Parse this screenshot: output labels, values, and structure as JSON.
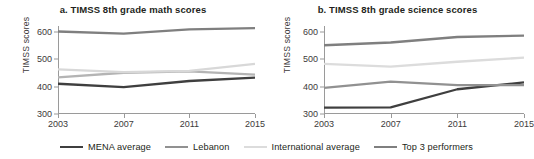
{
  "chart_data": [
    {
      "type": "line",
      "panel": "a",
      "title": "a. TIMSS 8th grade math scores",
      "xlabel": "",
      "ylabel": "TIMSS scores",
      "x": [
        2003,
        2007,
        2011,
        2015
      ],
      "xticklabels": [
        "2003",
        "2007",
        "2011",
        "2015"
      ],
      "yticks": [
        300,
        400,
        500,
        600
      ],
      "yticklabels": [
        "300",
        "400",
        "500",
        "600"
      ],
      "ylim": [
        300,
        620
      ],
      "xlim": [
        2003,
        2015
      ],
      "grid": false,
      "legend": "bottom",
      "series": [
        {
          "name": "MENA average",
          "color": "#3f3f3f",
          "values": [
            410,
            398,
            420,
            432
          ]
        },
        {
          "name": "Lebanon",
          "color": "#b4b4b4",
          "values": [
            433,
            450,
            455,
            443
          ]
        },
        {
          "name": "International average",
          "color": "#d8d8d8",
          "values": [
            462,
            452,
            457,
            482
          ]
        },
        {
          "name": "Top 3 performers",
          "color": "#7f7f7f",
          "values": [
            600,
            592,
            608,
            612
          ]
        }
      ]
    },
    {
      "type": "line",
      "panel": "b",
      "title": "b. TIMSS 8th grade science scores",
      "xlabel": "",
      "ylabel": "TIMSS scores",
      "x": [
        2003,
        2007,
        2011,
        2015
      ],
      "xticklabels": [
        "2003",
        "2007",
        "2011",
        "2015"
      ],
      "yticks": [
        300,
        400,
        500,
        600
      ],
      "yticklabels": [
        "300",
        "400",
        "500",
        "600"
      ],
      "ylim": [
        300,
        620
      ],
      "xlim": [
        2003,
        2015
      ],
      "grid": false,
      "legend": "bottom",
      "series": [
        {
          "name": "MENA average",
          "color": "#3f3f3f",
          "values": [
            323,
            324,
            390,
            415
          ]
        },
        {
          "name": "Lebanon",
          "color": "#919191",
          "values": [
            395,
            418,
            405,
            405
          ]
        },
        {
          "name": "International average",
          "color": "#dcdcdc",
          "values": [
            482,
            472,
            490,
            505
          ]
        },
        {
          "name": "Top 3 performers",
          "color": "#7f7f7f",
          "values": [
            550,
            560,
            580,
            585
          ]
        }
      ]
    }
  ],
  "legend": {
    "items": [
      {
        "label": "MENA average",
        "color": "#3f3f3f"
      },
      {
        "label": "Lebanon",
        "color": "#919191"
      },
      {
        "label": "International average",
        "color": "#dcdcdc"
      },
      {
        "label": "Top 3 performers",
        "color": "#7f7f7f"
      }
    ]
  }
}
